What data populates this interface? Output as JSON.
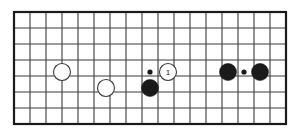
{
  "diagram": {
    "type": "go-board-diagram",
    "board": {
      "columns": 17,
      "rows": 7,
      "cell_size": 16,
      "origin_x": 14,
      "origin_y": 12,
      "line_color": "#3a3a3a",
      "border_color": "#1a1a1a",
      "background_color": "#ffffff",
      "line_width": 1.1,
      "border_width": 2.2
    },
    "colors": {
      "black_stone": "#1a1a1a",
      "white_stone": "#ffffff",
      "white_stone_outline": "#3a3a3a",
      "star_point": "#1a1a1a",
      "number_text": "#1a1a1a"
    },
    "stone_radius": 8.5,
    "star_point_radius": 2.6,
    "stones": [
      {
        "id": "white-stone-a",
        "color": "white",
        "col": 3,
        "row": 3,
        "cx": 62,
        "cy": 72,
        "label": ""
      },
      {
        "id": "white-stone-b",
        "color": "white",
        "col": 6,
        "row": 4,
        "cx": 106,
        "cy": 88,
        "label": ""
      },
      {
        "id": "black-stone-a",
        "color": "black",
        "col": 8,
        "row": 4,
        "cx": 150,
        "cy": 88,
        "label": ""
      },
      {
        "id": "white-stone-move-1",
        "color": "white",
        "col": 9,
        "row": 3,
        "cx": 168,
        "cy": 72,
        "label": "1"
      },
      {
        "id": "black-stone-b",
        "color": "black",
        "col": 13,
        "row": 3,
        "cx": 228,
        "cy": 72,
        "label": ""
      },
      {
        "id": "black-stone-c",
        "color": "black",
        "col": 15,
        "row": 3,
        "cx": 260,
        "cy": 72,
        "label": ""
      }
    ],
    "star_points": [
      {
        "id": "star-point-left",
        "col": 8,
        "row": 3,
        "cx": 150,
        "cy": 72
      },
      {
        "id": "star-point-right",
        "col": 14,
        "row": 3,
        "cx": 244,
        "cy": 72
      }
    ],
    "move_labels": [
      {
        "number": "1",
        "stone": "white-stone-move-1"
      }
    ]
  }
}
